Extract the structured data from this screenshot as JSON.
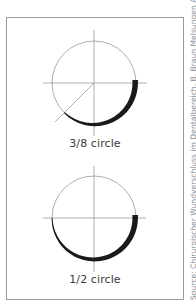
{
  "diagrams": [
    {
      "label": "3/8 circle",
      "arc_fraction": 0.375
    },
    {
      "label": "1/2 circle",
      "arc_fraction": 0.5
    }
  ],
  "source": "Source: Chirurgischer Wundverschluss im Dentalbereich, B. Braun Melsungen AG",
  "colors": {
    "needle": "#1a1a1a",
    "guide": "#8c8c8c",
    "frame": "#9a9a9a",
    "text": "#3a3a3a"
  }
}
